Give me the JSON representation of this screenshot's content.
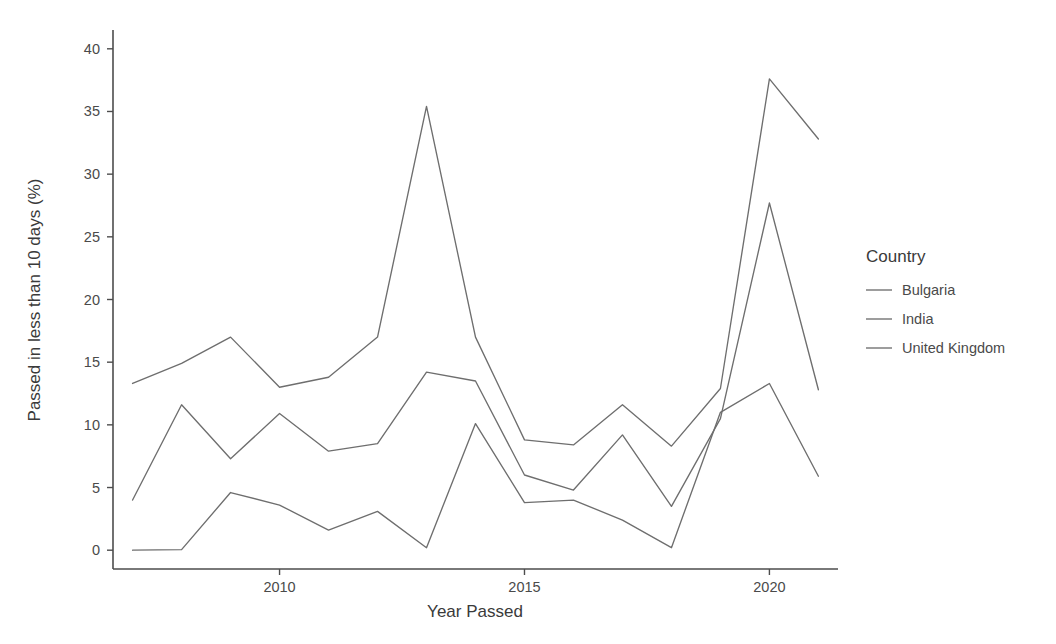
{
  "chart_data": {
    "type": "line",
    "title": "",
    "xlabel": "Year Passed",
    "ylabel": "Passed in less than 10 days (%)",
    "x": [
      2007,
      2008,
      2009,
      2010,
      2011,
      2012,
      2013,
      2014,
      2015,
      2016,
      2017,
      2018,
      2019,
      2020,
      2021
    ],
    "xlim": [
      2006.6,
      2021.4
    ],
    "ylim": [
      -1.5,
      41.5
    ],
    "xticks": [
      2010,
      2015,
      2020
    ],
    "xtick_labels": [
      "2010",
      "2015",
      "2020"
    ],
    "yticks": [
      0,
      5,
      10,
      15,
      20,
      25,
      30,
      35,
      40
    ],
    "ytick_labels": [
      "0",
      "5",
      "10",
      "15",
      "20",
      "25",
      "30",
      "35",
      "40"
    ],
    "grid": false,
    "legend_position": "right",
    "legend_title": "Country",
    "series": [
      {
        "name": "Bulgaria",
        "color": "#6e6e6e",
        "values": [
          13.3,
          14.9,
          17.0,
          13.0,
          13.8,
          17.0,
          35.4,
          17.0,
          8.8,
          8.4,
          11.6,
          8.3,
          12.9,
          37.6,
          32.8
        ]
      },
      {
        "name": "India",
        "color": "#6e6e6e",
        "values": [
          4.0,
          11.6,
          7.3,
          10.9,
          7.9,
          8.5,
          14.2,
          13.5,
          6.0,
          4.8,
          9.2,
          3.5,
          10.5,
          27.7,
          12.8
        ]
      },
      {
        "name": "United Kingdom",
        "color": "#6e6e6e",
        "values": [
          0.0,
          0.05,
          4.6,
          3.6,
          1.6,
          3.1,
          0.2,
          10.1,
          3.8,
          4.0,
          2.4,
          0.2,
          11.0,
          13.3,
          5.9
        ]
      }
    ]
  },
  "legend": {
    "title": "Country",
    "items": [
      {
        "label": "Bulgaria"
      },
      {
        "label": "India"
      },
      {
        "label": "United Kingdom"
      }
    ]
  },
  "axes": {
    "x_title": "Year Passed",
    "y_title": "Passed in less than 10 days (%)"
  },
  "colors": {
    "background": "#ffffff",
    "axis": "#4d4d4d",
    "text": "#3a3a3a",
    "line": "#6e6e6e"
  }
}
